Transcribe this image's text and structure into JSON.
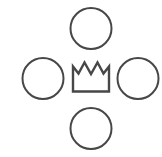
{
  "diagram": {
    "background_color": "#ffffff",
    "stroke_color": "#474747",
    "width": 162,
    "height": 157,
    "center": {
      "name": "crown",
      "icon": "crown-icon",
      "label": "",
      "shape": "crown",
      "cx": 91,
      "cy": 77,
      "bounds": {
        "x": 72,
        "y": 61,
        "width": 38,
        "height": 31
      },
      "peaks": 3,
      "stroke_width": 2.4,
      "path": "M 73 91.5 L 73 66.5 L 78.5 73.5 L 84.5 62.5 L 91 74 L 97.5 62.5 L 103.5 73.5 L 109 66.5 L 109 91.5 Z"
    },
    "nodes": [
      {
        "name": "circle-top",
        "position": "top",
        "shape": "circle",
        "label": "",
        "cx": 91,
        "cy": 28.5,
        "r": 20.5,
        "stroke_width": 2
      },
      {
        "name": "circle-left",
        "position": "left",
        "shape": "circle",
        "label": "",
        "cx": 43,
        "cy": 78.5,
        "r": 20.5,
        "stroke_width": 2
      },
      {
        "name": "circle-right",
        "position": "right",
        "shape": "circle",
        "label": "",
        "cx": 138,
        "cy": 78.5,
        "r": 20.5,
        "stroke_width": 2
      },
      {
        "name": "circle-bottom",
        "position": "bottom",
        "shape": "circle",
        "label": "",
        "cx": 91,
        "cy": 128.5,
        "r": 20.5,
        "stroke_width": 2
      }
    ]
  }
}
